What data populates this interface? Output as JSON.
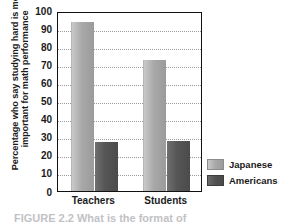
{
  "chart_data": {
    "type": "bar",
    "title": "",
    "xlabel": "",
    "ylabel_line1": "Percentage who say studying hard is most",
    "ylabel_line2": "important for math performance",
    "categories": [
      "Teachers",
      "Students"
    ],
    "series": [
      {
        "name": "Japanese",
        "values": [
          94,
          73
        ],
        "color": "#a8a8a8"
      },
      {
        "name": "Americans",
        "values": [
          27,
          28
        ],
        "color": "#525252"
      }
    ],
    "ylim": [
      0,
      100
    ],
    "ytick_values": [
      100,
      90,
      80,
      70,
      60,
      50,
      40,
      30,
      20,
      10,
      0
    ],
    "grid": true,
    "grid_style": "dotted",
    "legend_position": "right"
  },
  "axis": {
    "yticks": [
      "100",
      "90",
      "80",
      "70",
      "60",
      "50",
      "40",
      "30",
      "20",
      "10"
    ],
    "zero": "0",
    "xticks": [
      "Teachers",
      "Students"
    ]
  },
  "legend": {
    "items": [
      {
        "label": "Japanese"
      },
      {
        "label": "Americans"
      }
    ]
  },
  "caption": {
    "text": "FIGURE 2.2  What is the format of"
  }
}
